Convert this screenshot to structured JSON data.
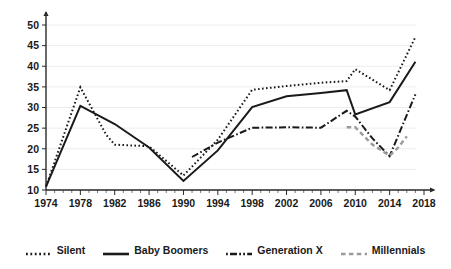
{
  "chart_data": {
    "type": "line",
    "title": "",
    "subtitle": "",
    "xlabel": "",
    "ylabel": "",
    "xlim": [
      1974,
      2018
    ],
    "ylim": [
      10,
      52
    ],
    "grid": true,
    "legend_position": "bottom",
    "yticks": [
      10,
      15,
      20,
      25,
      30,
      35,
      40,
      45,
      50
    ],
    "xticks": [
      1974,
      1978,
      1982,
      1986,
      1990,
      1994,
      1998,
      2002,
      2006,
      2010,
      2014,
      2018
    ],
    "xtick_minor_step": 1,
    "series": [
      {
        "name": "Silent",
        "style": "dotted",
        "color": "#1a1a1a",
        "x": [
          1974,
          1978,
          1981,
          1982,
          1986,
          1990,
          1994,
          1998,
          2002,
          2006,
          2009,
          2010,
          2014,
          2017
        ],
        "values": [
          10.8,
          34.9,
          23.4,
          21.0,
          20.6,
          13.5,
          22.2,
          34.3,
          35.2,
          36.0,
          36.4,
          39.3,
          34.2,
          47.1
        ]
      },
      {
        "name": "Baby Boomers",
        "style": "solid",
        "color": "#1a1a1a",
        "x": [
          1974,
          1978,
          1982,
          1986,
          1990,
          1994,
          1998,
          2002,
          2006,
          2009,
          2010,
          2014,
          2017
        ],
        "values": [
          10.8,
          30.4,
          26.0,
          20.3,
          12.2,
          19.6,
          30.1,
          32.7,
          33.5,
          34.2,
          28.3,
          31.3,
          41.1
        ]
      },
      {
        "name": "Generation X",
        "style": "dash-dot",
        "color": "#1a1a1a",
        "x": [
          1991,
          1994,
          1998,
          2002,
          2006,
          2009,
          2010,
          2012,
          2014,
          2017
        ],
        "values": [
          18.0,
          21.5,
          25.1,
          25.2,
          25.1,
          29.2,
          27.8,
          22.5,
          18.2,
          33.2
        ]
      },
      {
        "name": "Millennials",
        "style": "dashed",
        "color": "#9a9a9a",
        "x": [
          2009,
          2010,
          2012,
          2014,
          2015,
          2016
        ],
        "values": [
          25.2,
          25.2,
          21.0,
          18.3,
          20.3,
          23.0
        ]
      }
    ]
  },
  "legend": {
    "items": [
      {
        "label": "Silent",
        "swatch": "dotted-line-swatch"
      },
      {
        "label": "Baby Boomers",
        "swatch": "solid-line-swatch"
      },
      {
        "label": "Generation X",
        "swatch": "dash-dot-line-swatch"
      },
      {
        "label": "Millennials",
        "swatch": "dashed-gray-line-swatch"
      }
    ]
  },
  "axes": {
    "y_labels": [
      "50",
      "45",
      "40",
      "35",
      "30",
      "25",
      "20",
      "15",
      "10"
    ],
    "x_labels": [
      "1974",
      "1978",
      "1982",
      "1986",
      "1990",
      "1994",
      "1998",
      "2002",
      "2006",
      "2010",
      "2014",
      "2018"
    ]
  }
}
